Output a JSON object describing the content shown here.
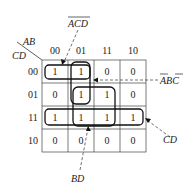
{
  "kmap": {
    "row_var": "CD",
    "col_var": "AB",
    "col_headers": [
      "00",
      "01",
      "11",
      "10"
    ],
    "row_headers": [
      "00",
      "01",
      "11",
      "10"
    ],
    "cells": [
      [
        "1",
        "1",
        "0",
        "0"
      ],
      [
        "0",
        "1",
        "1",
        "0"
      ],
      [
        "1",
        "1",
        "1",
        "1"
      ],
      [
        "0",
        "0",
        "0",
        "0"
      ]
    ]
  },
  "groups": {
    "acd": "ACD",
    "abc": "ABC",
    "cd": "CD",
    "bd": "BD"
  }
}
